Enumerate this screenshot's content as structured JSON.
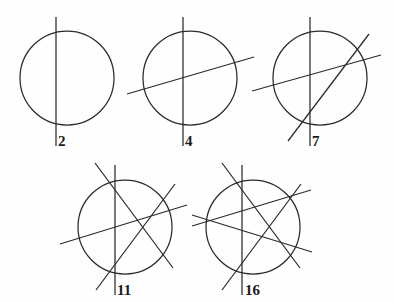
{
  "figure": {
    "background_color": "#fefefe",
    "ink_color": "#2b2b2b",
    "label_color": "#1a1a1a",
    "width": 393,
    "height": 302
  },
  "chart_data": {
    "type": "diagram",
    "xlabel": "",
    "ylabel": "",
    "categories": [
      "1 line",
      "2 lines",
      "3 lines",
      "4 lines",
      "5 lines"
    ],
    "values": [
      2,
      4,
      7,
      11,
      16
    ],
    "series": [
      {
        "name": "lines",
        "values": [
          1,
          2,
          3,
          4,
          5
        ]
      },
      {
        "name": "regions",
        "values": [
          2,
          4,
          7,
          11,
          16
        ]
      }
    ],
    "panels": [
      {
        "id": "panel-1",
        "label": "2",
        "lines_count": 1,
        "regions": 2,
        "circle": {
          "cx": 67,
          "cy": 78,
          "r": 47
        },
        "label_pos": {
          "x": 58,
          "y": 146
        },
        "lines": [
          {
            "name": "vertical-line",
            "x1": 56,
            "y1": 17,
            "x2": 56,
            "y2": 146
          }
        ]
      },
      {
        "id": "panel-2",
        "label": "4",
        "lines_count": 2,
        "regions": 4,
        "circle": {
          "cx": 190,
          "cy": 78,
          "r": 47
        },
        "label_pos": {
          "x": 185,
          "y": 146
        },
        "lines": [
          {
            "name": "vertical-line",
            "x1": 183,
            "y1": 17,
            "x2": 183,
            "y2": 146
          },
          {
            "name": "shallow-rising-line",
            "x1": 127,
            "y1": 94,
            "x2": 254,
            "y2": 57
          }
        ]
      },
      {
        "id": "panel-3",
        "label": "7",
        "lines_count": 3,
        "regions": 7,
        "circle": {
          "cx": 320,
          "cy": 78,
          "r": 47
        },
        "label_pos": {
          "x": 312,
          "y": 146
        },
        "lines": [
          {
            "name": "vertical-line",
            "x1": 310,
            "y1": 17,
            "x2": 310,
            "y2": 146
          },
          {
            "name": "shallow-rising-line",
            "x1": 252,
            "y1": 91,
            "x2": 381,
            "y2": 55
          },
          {
            "name": "steep-rising-line",
            "x1": 288,
            "y1": 141,
            "x2": 369,
            "y2": 34
          }
        ]
      },
      {
        "id": "panel-4",
        "label": "11",
        "lines_count": 4,
        "regions": 11,
        "circle": {
          "cx": 125,
          "cy": 227,
          "r": 47
        },
        "label_pos": {
          "x": 117,
          "y": 295
        },
        "lines": [
          {
            "name": "vertical-line",
            "x1": 115,
            "y1": 165,
            "x2": 115,
            "y2": 295
          },
          {
            "name": "shallow-rising-line",
            "x1": 60,
            "y1": 244,
            "x2": 187,
            "y2": 205
          },
          {
            "name": "steep-rising-line",
            "x1": 96,
            "y1": 290,
            "x2": 175,
            "y2": 184
          },
          {
            "name": "steep-falling-line",
            "x1": 95,
            "y1": 163,
            "x2": 173,
            "y2": 268
          }
        ]
      },
      {
        "id": "panel-5",
        "label": "16",
        "lines_count": 5,
        "regions": 16,
        "circle": {
          "cx": 253,
          "cy": 227,
          "r": 47
        },
        "label_pos": {
          "x": 245,
          "y": 295
        },
        "lines": [
          {
            "name": "vertical-line",
            "x1": 242,
            "y1": 165,
            "x2": 242,
            "y2": 295
          },
          {
            "name": "shallow-rising-line",
            "x1": 192,
            "y1": 226,
            "x2": 311,
            "y2": 190
          },
          {
            "name": "shallow-falling-line",
            "x1": 192,
            "y1": 215,
            "x2": 312,
            "y2": 252
          },
          {
            "name": "steep-rising-line",
            "x1": 222,
            "y1": 290,
            "x2": 301,
            "y2": 184
          },
          {
            "name": "steep-falling-line",
            "x1": 222,
            "y1": 163,
            "x2": 300,
            "y2": 268
          }
        ]
      }
    ]
  }
}
